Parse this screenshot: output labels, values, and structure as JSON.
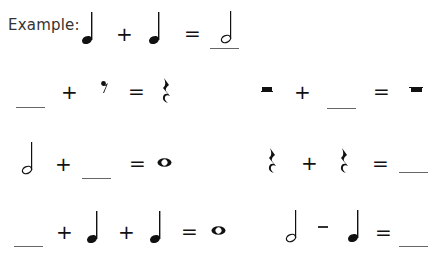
{
  "worksheet": {
    "example_label": "Example:",
    "operators": {
      "plus": "+",
      "minus": "–",
      "equals": "="
    },
    "problems": [
      {
        "id": "example",
        "terms": [
          "quarter-note",
          "+",
          "quarter-note",
          "=",
          "half-note (underlined answer)"
        ]
      },
      {
        "id": "row1-left",
        "terms": [
          "blank",
          "+",
          "eighth-rest",
          "=",
          "quarter-rest"
        ]
      },
      {
        "id": "row1-right",
        "terms": [
          "half-rest",
          "+",
          "blank",
          "=",
          "whole-rest"
        ]
      },
      {
        "id": "row2-left",
        "terms": [
          "half-note",
          "+",
          "blank",
          "=",
          "whole-note"
        ]
      },
      {
        "id": "row2-right",
        "terms": [
          "quarter-rest",
          "+",
          "quarter-rest",
          "=",
          "blank"
        ]
      },
      {
        "id": "row3-left",
        "terms": [
          "blank",
          "+",
          "quarter-note",
          "+",
          "quarter-note",
          "=",
          "whole-note"
        ]
      },
      {
        "id": "row3-right",
        "terms": [
          "half-note",
          "-",
          "quarter-note",
          "=",
          "blank"
        ]
      }
    ],
    "ink_color": "#111111",
    "blank_line_color": "#666666"
  }
}
